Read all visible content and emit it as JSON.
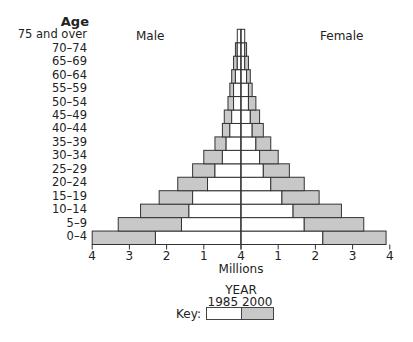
{
  "chart_data": {
    "type": "bar",
    "subtype": "population-pyramid",
    "title": "",
    "ylabel": "Age",
    "xlabel": "Millions",
    "left_label": "Male",
    "right_label": "Female",
    "x_ticks": [
      "4",
      "3",
      "2",
      "1",
      "4",
      "1",
      "2",
      "3",
      "4"
    ],
    "xlim": [
      -4,
      4
    ],
    "categories": [
      "0–4",
      "5–9",
      "10–14",
      "15–19",
      "20–24",
      "25–29",
      "30–34",
      "35–39",
      "40–44",
      "45–49",
      "50–54",
      "55–59",
      "60–64",
      "65–69",
      "70–74",
      "75 and over"
    ],
    "series": [
      {
        "name": "Male 1985",
        "year": "1985",
        "side": "left",
        "color": "#ffffff",
        "values": [
          2.3,
          1.6,
          1.4,
          1.3,
          0.9,
          0.7,
          0.5,
          0.4,
          0.3,
          0.25,
          0.2,
          0.2,
          0.15,
          0.1,
          0.1,
          0.1
        ]
      },
      {
        "name": "Male 2000",
        "year": "2000",
        "side": "left",
        "color": "#c8c8c8",
        "values": [
          4.0,
          3.3,
          2.7,
          2.2,
          1.7,
          1.3,
          1.0,
          0.7,
          0.5,
          0.45,
          0.35,
          0.3,
          0.25,
          0.2,
          0.15,
          0.1
        ]
      },
      {
        "name": "Female 1985",
        "year": "1985",
        "side": "right",
        "color": "#ffffff",
        "values": [
          2.2,
          1.7,
          1.4,
          1.1,
          0.8,
          0.6,
          0.5,
          0.4,
          0.3,
          0.25,
          0.2,
          0.2,
          0.15,
          0.1,
          0.1,
          0.1
        ]
      },
      {
        "name": "Female 2000",
        "year": "2000",
        "side": "right",
        "color": "#c8c8c8",
        "values": [
          3.9,
          3.3,
          2.7,
          2.1,
          1.7,
          1.3,
          1.0,
          0.8,
          0.6,
          0.5,
          0.4,
          0.3,
          0.25,
          0.2,
          0.15,
          0.1
        ]
      }
    ],
    "legend": {
      "title": "YEAR",
      "prefix": "Key:",
      "entries": [
        {
          "label": "1985",
          "color": "#ffffff"
        },
        {
          "label": "2000",
          "color": "#c8c8c8"
        }
      ]
    },
    "grid": false
  },
  "labels": {
    "age_title": "Age",
    "male": "Male",
    "female": "Female",
    "millions": "Millions",
    "year": "YEAR",
    "year_1985": "1985",
    "year_2000": "2000",
    "key": "Key:",
    "ticks": [
      "4",
      "3",
      "2",
      "1",
      "4",
      "1",
      "2",
      "3",
      "4"
    ],
    "ages_top_down": [
      "75 and over",
      "70–74",
      "65–69",
      "60–64",
      "55–59",
      "50–54",
      "45–49",
      "40–44",
      "35–39",
      "30–34",
      "25–29",
      "20–24",
      "15–19",
      "10–14",
      "5–9",
      "0–4"
    ]
  }
}
